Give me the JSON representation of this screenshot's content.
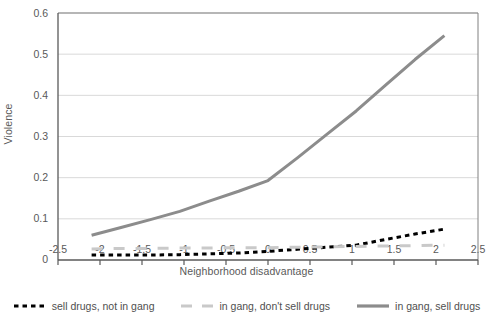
{
  "chart_data": {
    "type": "line",
    "title": "",
    "xlabel": "Neighborhood disadvantage",
    "ylabel": "Violence",
    "xlim": [
      -2.5,
      2.5
    ],
    "ylim": [
      0,
      0.6
    ],
    "xticks": [
      "-2.5",
      "-2",
      "-1.5",
      "-1",
      "-0.5",
      "0",
      "0.5",
      "1",
      "1.5",
      "2",
      "2.5"
    ],
    "yticks": [
      "0",
      "0.1",
      "0.2",
      "0.3",
      "0.4",
      "0.5",
      "0.6"
    ],
    "grid": "horizontal",
    "legend_position": "bottom",
    "x": [
      -2.1,
      -1.75,
      -1.4,
      -1.05,
      -0.7,
      -0.35,
      0,
      0.35,
      0.7,
      1.05,
      1.4,
      1.75,
      2.1
    ],
    "series": [
      {
        "name": "sell drugs, not in gang",
        "style": "dashed",
        "color": "#000000",
        "width": 3,
        "values": [
          0.012,
          0.012,
          0.012,
          0.013,
          0.015,
          0.017,
          0.021,
          0.026,
          0.031,
          0.036,
          0.05,
          0.063,
          0.075
        ]
      },
      {
        "name": "in gang, don't sell drugs",
        "style": "dashed",
        "color": "#c9c9c9",
        "width": 3,
        "values": [
          0.027,
          0.028,
          0.028,
          0.029,
          0.029,
          0.03,
          0.03,
          0.031,
          0.032,
          0.033,
          0.034,
          0.035,
          0.036
        ]
      },
      {
        "name": "in gang, sell drugs",
        "style": "solid",
        "color": "#8c8c8c",
        "width": 3,
        "values": [
          0.06,
          0.079,
          0.098,
          0.118,
          0.143,
          0.167,
          0.193,
          0.248,
          0.305,
          0.362,
          0.425,
          0.487,
          0.545
        ]
      }
    ]
  },
  "axes": {
    "ylabel": "Violence",
    "xlabel": "Neighborhood disadvantage",
    "yticks": [
      "0.6",
      "0.5",
      "0.4",
      "0.3",
      "0.2",
      "0.1",
      "0"
    ],
    "xticks": [
      "-2.5",
      "-2",
      "-1.5",
      "-1",
      "-0.5",
      "0",
      "0.5",
      "1",
      "1.5",
      "2",
      "2.5"
    ]
  },
  "legend": {
    "items": [
      {
        "label": "sell drugs, not in gang",
        "marker": "dashed-black-line-icon"
      },
      {
        "label": "in gang, don't sell drugs",
        "marker": "dashed-gray-line-icon"
      },
      {
        "label": "in gang, sell drugs",
        "marker": "solid-gray-line-icon"
      }
    ]
  },
  "colors": {
    "series_black": "#000000",
    "series_light_gray": "#c9c9c9",
    "series_gray": "#8c8c8c",
    "grid": "#d9d9d9",
    "axis": "#595959",
    "text": "#4f4f4f"
  }
}
